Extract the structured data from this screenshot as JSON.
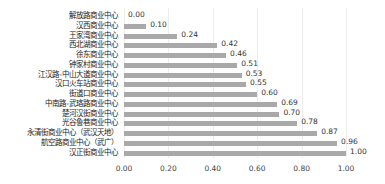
{
  "chart_data": {
    "type": "bar",
    "orientation": "horizontal",
    "title": "",
    "xlabel": "",
    "ylabel": "",
    "xlim": [
      0,
      1.0
    ],
    "grid": true,
    "legend": null,
    "categories": [
      "解放路商业中心",
      "汉西商业中心",
      "王家湾商业中心",
      "西北湖商业中心",
      "徐东商业中心",
      "钟家村商业中心",
      "江汉路-中山大道商业中心",
      "汉口火车站商业中心",
      "街道口商业中心",
      "中南路-武珞路商业中心",
      "楚河汉街商业中心",
      "光谷鲁巷商业中心",
      "永清街商业中心（武汉天地）",
      "航空路商业中心（武广）",
      "汉正街商业中心"
    ],
    "values": [
      0.0,
      0.1,
      0.24,
      0.42,
      0.46,
      0.51,
      0.53,
      0.55,
      0.6,
      0.69,
      0.7,
      0.78,
      0.87,
      0.96,
      1.0
    ],
    "value_labels": [
      "0.00",
      "0.10",
      "0.24",
      "0.42",
      "0.46",
      "0.51",
      "0.53",
      "0.55",
      "0.60",
      "0.69",
      "0.70",
      "0.78",
      "0.87",
      "0.96",
      "1.00"
    ],
    "x_ticks": [
      "0.00",
      "0.20",
      "0.40",
      "0.60",
      "0.80",
      "1.00"
    ],
    "bar_color": "#a9a9a9"
  }
}
